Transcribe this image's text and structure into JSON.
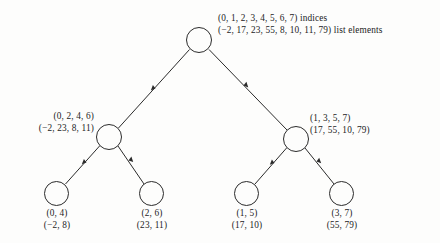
{
  "diagram": {
    "type": "binary-tree",
    "legend": {
      "indices_suffix": "indices",
      "elements_suffix": "list elements"
    },
    "nodes": [
      {
        "id": "root",
        "role": "root",
        "indices": "(0, 1, 2, 3, 4, 5, 6, 7)",
        "elements": "(−2, 17, 23, 55, 8, 10, 11, 79)",
        "indices_annotated": "(0, 1, 2, 3, 4, 5, 6, 7) indices",
        "elements_annotated": "(−2, 17, 23, 55, 8, 10, 11, 79) list elements",
        "cx": 199,
        "cy": 40,
        "r": 13
      },
      {
        "id": "left-internal",
        "role": "internal",
        "indices": "(0, 2, 4, 6)",
        "elements": "(−2, 23, 8, 11)",
        "cx": 109,
        "cy": 137,
        "r": 13
      },
      {
        "id": "right-internal",
        "role": "internal",
        "indices": "(1, 3, 5, 7)",
        "elements": "(17, 55, 10, 79)",
        "cx": 296,
        "cy": 139,
        "r": 13
      },
      {
        "id": "leaf-1",
        "role": "leaf",
        "indices": "(0, 4)",
        "elements": "(−2, 8)",
        "cx": 57,
        "cy": 193,
        "r": 12.5
      },
      {
        "id": "leaf-2",
        "role": "leaf",
        "indices": "(2, 6)",
        "elements": "(23, 11)",
        "cx": 152,
        "cy": 193,
        "r": 12.5
      },
      {
        "id": "leaf-3",
        "role": "leaf",
        "indices": "(1, 5)",
        "elements": "(17, 10)",
        "cx": 247,
        "cy": 193,
        "r": 12.5
      },
      {
        "id": "leaf-4",
        "role": "leaf",
        "indices": "(3, 7)",
        "elements": "(55, 79)",
        "cx": 342,
        "cy": 193,
        "r": 12.5
      }
    ],
    "edges": [
      {
        "id": "edge-left-internal-to-root",
        "from": "left-internal",
        "to": "root",
        "arrow": "up-right"
      },
      {
        "id": "edge-right-internal-to-root",
        "from": "right-internal",
        "to": "root",
        "arrow": "up-left"
      },
      {
        "id": "edge-leaf-1-to-left-internal",
        "from": "leaf-1",
        "to": "left-internal",
        "arrow": "up-right"
      },
      {
        "id": "edge-leaf-2-to-left-internal",
        "from": "leaf-2",
        "to": "left-internal",
        "arrow": "up-left"
      },
      {
        "id": "edge-leaf-3-to-right-internal",
        "from": "leaf-3",
        "to": "right-internal",
        "arrow": "up-right"
      },
      {
        "id": "edge-leaf-4-to-right-internal",
        "from": "leaf-4",
        "to": "right-internal",
        "arrow": "up-left"
      }
    ],
    "colors": {
      "background": "#fdfdfc",
      "stroke": "#2b2b2b",
      "text": "#1c1c1c"
    }
  }
}
